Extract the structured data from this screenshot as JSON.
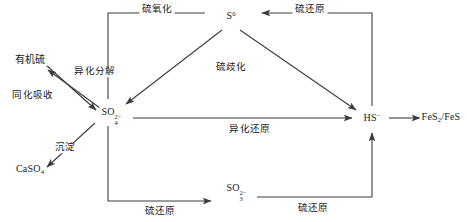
{
  "diagram": {
    "background": "#ffffff",
    "line_color": "#3c3c3c",
    "text_color": "#1a1a1a",
    "nodes": [
      {
        "id": "organic-sulfur",
        "label": "有机硫",
        "x": 30,
        "y": 60
      },
      {
        "id": "caso4",
        "label": "CaSO",
        "sub": "4",
        "sup": "",
        "x": 30,
        "y": 170
      },
      {
        "id": "sulfate",
        "label": "SO",
        "sub": "4",
        "sup": "2−",
        "x": 108,
        "y": 112
      },
      {
        "id": "elemental-s",
        "label": "S",
        "sub": "",
        "sup": "0",
        "x": 231,
        "y": 16
      },
      {
        "id": "sulfite",
        "label": "SO",
        "sub": "3",
        "sup": "2−",
        "x": 233,
        "y": 188
      },
      {
        "id": "bisulfide",
        "label": "HS",
        "sub": "",
        "sup": "−",
        "x": 372,
        "y": 118
      },
      {
        "id": "iron-sulfides",
        "label": "FeS",
        "sub": "2",
        "sup": "",
        "suffix": "/FeS",
        "x": 441,
        "y": 118
      }
    ],
    "edge_labels": [
      {
        "id": "sulfur-oxidation-top",
        "label": "硫氧化",
        "x": 157,
        "y": 10
      },
      {
        "id": "sulfur-reduction-top",
        "label": "硫还原",
        "x": 310,
        "y": 10
      },
      {
        "id": "sulfur-disproportionation",
        "label": "硫歧化",
        "x": 231,
        "y": 68
      },
      {
        "id": "dissimilatory-decomposition",
        "label": "异化分解",
        "x": 95,
        "y": 72
      },
      {
        "id": "assimilatory-uptake",
        "label": "同化吸收",
        "x": 33,
        "y": 96
      },
      {
        "id": "precipitation",
        "label": "沉淀",
        "x": 65,
        "y": 148
      },
      {
        "id": "dissimilatory-reduction",
        "label": "异化还原",
        "x": 250,
        "y": 130
      },
      {
        "id": "sulfur-reduction-bottom-left",
        "label": "硫还原",
        "x": 160,
        "y": 212
      },
      {
        "id": "sulfur-reduction-bottom-right",
        "label": "硫还原",
        "x": 313,
        "y": 209
      }
    ]
  }
}
